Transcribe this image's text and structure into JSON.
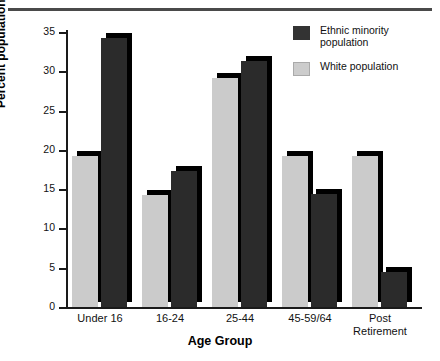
{
  "chart_data": {
    "type": "bar",
    "title": "",
    "xlabel": "Age Group",
    "ylabel": "Percent population",
    "categories": [
      "Under 16",
      "16-24",
      "25-44",
      "45-59/64",
      "Post\nRetirement"
    ],
    "series": [
      {
        "name": "Ethnic minority population",
        "color": "#2b2b2b",
        "values": [
          34.2,
          17.3,
          31.3,
          14.4,
          4.5
        ]
      },
      {
        "name": "White population",
        "color": "#cbcbcb",
        "values": [
          19.2,
          14.3,
          29.2,
          19.2,
          19.2
        ]
      }
    ],
    "ylim": [
      0,
      35
    ],
    "yticks": [
      0,
      5,
      10,
      15,
      20,
      25,
      30,
      35
    ],
    "ytick_labels": [
      "0",
      "5",
      "10",
      "15",
      "20",
      "25",
      "30",
      "35"
    ],
    "grid": false,
    "legend_position": "top-right",
    "bar_style": "3d-drop-shadow"
  },
  "legend": {
    "entries": [
      {
        "label": "Ethnic minority\npopulation",
        "swatch": "dark"
      },
      {
        "label": "White population",
        "swatch": "light"
      }
    ]
  },
  "axes": {
    "y_title": "Percent population",
    "x_title": "Age Group"
  }
}
